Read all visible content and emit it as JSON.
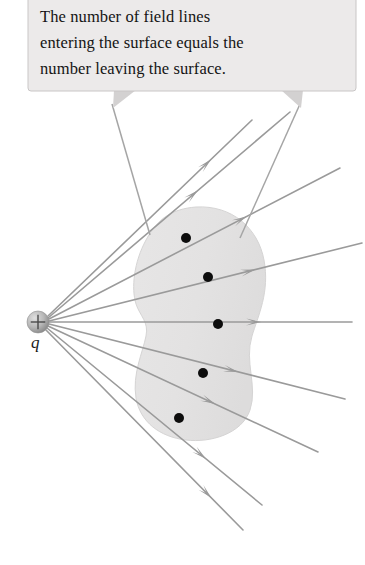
{
  "figure": {
    "type": "physics-diagram",
    "background_color": "#ffffff"
  },
  "callout": {
    "line1": "The number of field lines",
    "line2": "entering the surface equals the",
    "line3": "number leaving the surface.",
    "full_text": "The number of field lines entering the surface equals the number leaving the surface.",
    "fill_color": "#eceaea",
    "border_color": "#c9c6c6",
    "text_color": "#141414",
    "box": {
      "x": 28,
      "y": 0,
      "width": 328,
      "height": 92
    },
    "tails": [
      {
        "name": "tail-left",
        "apex_x": 125,
        "apex_y": 92,
        "tip_x": 112,
        "tip_y": 108
      },
      {
        "name": "tail-right",
        "apex_x": 290,
        "apex_y": 92,
        "tip_x": 300,
        "tip_y": 108
      }
    ]
  },
  "charge": {
    "label": "q",
    "sign": "+",
    "center_x": 38,
    "center_y": 322,
    "radius": 11,
    "fill_light": "#d8d8d8",
    "fill_dark": "#8f8f8f",
    "label_color": "#1a1a1a"
  },
  "surface": {
    "name": "gaussian-surface",
    "shape": "kidney-blob",
    "fill_color": "#e4e3e3",
    "edge_color": "#d7d6d6",
    "bounds": {
      "x": 133,
      "y": 206,
      "width": 134,
      "height": 236
    }
  },
  "field_lines": {
    "color": "#9a9a9a",
    "stroke_width": 1.6,
    "count": 9,
    "arrow_color": "#9a9a9a",
    "lines": [
      {
        "name": "field-line-1",
        "x1": 48,
        "y1": 316,
        "x2": 252,
        "y2": 120,
        "arrow_t": 0.8
      },
      {
        "name": "field-line-2",
        "x1": 48,
        "y1": 318,
        "x2": 290,
        "y2": 112,
        "arrow_t": 0.62
      },
      {
        "name": "field-line-3",
        "x1": 49,
        "y1": 319,
        "x2": 340,
        "y2": 168,
        "arrow_t": 0.68
      },
      {
        "name": "field-line-4",
        "x1": 49,
        "y1": 321,
        "x2": 362,
        "y2": 243,
        "arrow_t": 0.66
      },
      {
        "name": "field-line-5",
        "x1": 49,
        "y1": 322,
        "x2": 352,
        "y2": 322,
        "arrow_t": 0.7
      },
      {
        "name": "field-line-6",
        "x1": 49,
        "y1": 324,
        "x2": 345,
        "y2": 399,
        "arrow_t": 0.64
      },
      {
        "name": "field-line-7",
        "x1": 48,
        "y1": 326,
        "x2": 318,
        "y2": 452,
        "arrow_t": 0.62
      },
      {
        "name": "field-line-8",
        "x1": 47,
        "y1": 328,
        "x2": 262,
        "y2": 505,
        "arrow_t": 0.74
      },
      {
        "name": "field-line-9",
        "x1": 46,
        "y1": 330,
        "x2": 243,
        "y2": 530,
        "arrow_t": 0.84
      }
    ]
  },
  "intersection_points": {
    "name": "surface-piercing-points",
    "color": "#0d0d0d",
    "radius": 5,
    "points": [
      {
        "name": "dot-1",
        "x": 186,
        "y": 238
      },
      {
        "name": "dot-2",
        "x": 208,
        "y": 277
      },
      {
        "name": "dot-3",
        "x": 218,
        "y": 324
      },
      {
        "name": "dot-4",
        "x": 203,
        "y": 373
      },
      {
        "name": "dot-5",
        "x": 179,
        "y": 418
      }
    ]
  }
}
